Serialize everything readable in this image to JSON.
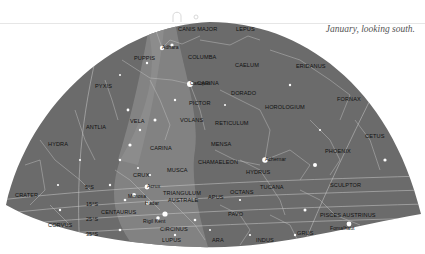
{
  "caption": "January, looking south.",
  "colors": {
    "sky": "#6b6b6b",
    "milky_way": "#8a8a8a",
    "lines": "#c8c8c8",
    "stars": "#ffffff",
    "labels": "#111111",
    "background": "#ffffff"
  },
  "constellations": [
    {
      "name": "CANIS MAJOR",
      "x": 178,
      "y": 30
    },
    {
      "name": "LEPUS",
      "x": 236,
      "y": 30
    },
    {
      "name": "PUPPIS",
      "x": 134,
      "y": 59
    },
    {
      "name": "COLUMBA",
      "x": 188,
      "y": 58
    },
    {
      "name": "CAELUM",
      "x": 235,
      "y": 66
    },
    {
      "name": "ERIDANUS",
      "x": 296,
      "y": 67
    },
    {
      "name": "PYXIS",
      "x": 95,
      "y": 87
    },
    {
      "name": "CARINA",
      "x": 197,
      "y": 84
    },
    {
      "name": "DORADO",
      "x": 231,
      "y": 94
    },
    {
      "name": "PICTOR",
      "x": 189,
      "y": 104
    },
    {
      "name": "HOROLOGIUM",
      "x": 265,
      "y": 108
    },
    {
      "name": "FORNAX",
      "x": 337,
      "y": 100
    },
    {
      "name": "VELA",
      "x": 130,
      "y": 122
    },
    {
      "name": "VOLANS",
      "x": 180,
      "y": 121
    },
    {
      "name": "RETICULUM",
      "x": 215,
      "y": 124
    },
    {
      "name": "ANTLIA",
      "x": 86,
      "y": 128
    },
    {
      "name": "CETUS",
      "x": 365,
      "y": 137
    },
    {
      "name": "MENSA",
      "x": 211,
      "y": 145
    },
    {
      "name": "HYDRA",
      "x": 48,
      "y": 145
    },
    {
      "name": "CARINA",
      "x": 150,
      "y": 149
    },
    {
      "name": "PHOENIX",
      "x": 325,
      "y": 152
    },
    {
      "name": "CHAMAELEON",
      "x": 198,
      "y": 163
    },
    {
      "name": "HYDRUS",
      "x": 246,
      "y": 173
    },
    {
      "name": "MUSCA",
      "x": 167,
      "y": 171
    },
    {
      "name": "CRUX",
      "x": 133,
      "y": 176
    },
    {
      "name": "SCULPTOR",
      "x": 330,
      "y": 186
    },
    {
      "name": "TUCANA",
      "x": 260,
      "y": 188
    },
    {
      "name": "OCTANS",
      "x": 230,
      "y": 193
    },
    {
      "name": "TRIANGULUM",
      "x": 163,
      "y": 194
    },
    {
      "name": "AUSTRALE",
      "x": 168,
      "y": 201
    },
    {
      "name": "APUS",
      "x": 208,
      "y": 198
    },
    {
      "name": "CRATER",
      "x": 15,
      "y": 196
    },
    {
      "name": "CENTAURUS",
      "x": 101,
      "y": 213
    },
    {
      "name": "PAVO",
      "x": 228,
      "y": 215
    },
    {
      "name": "PISCES AUSTRINUS",
      "x": 320,
      "y": 216
    },
    {
      "name": "CORVUS",
      "x": 48,
      "y": 226
    },
    {
      "name": "CIRCINUS",
      "x": 160,
      "y": 230
    },
    {
      "name": "GRUS",
      "x": 297,
      "y": 234
    },
    {
      "name": "LUPUS",
      "x": 162,
      "y": 241
    },
    {
      "name": "ARA",
      "x": 212,
      "y": 241
    },
    {
      "name": "INDUS",
      "x": 256,
      "y": 241
    }
  ],
  "stars": [
    {
      "name": "Adhara",
      "x": 162,
      "y": 48
    },
    {
      "name": "Canopus",
      "x": 190,
      "y": 84
    },
    {
      "name": "Achernar",
      "x": 265,
      "y": 160
    },
    {
      "name": "Acrux",
      "x": 147,
      "y": 187
    },
    {
      "name": "Mimosa",
      "x": 128,
      "y": 197
    },
    {
      "name": "Hadar",
      "x": 145,
      "y": 204
    },
    {
      "name": "Rigil Kent",
      "x": 143,
      "y": 222
    },
    {
      "name": "Fomalhaut",
      "x": 330,
      "y": 229
    }
  ],
  "declinations": [
    {
      "label": "5°S",
      "x": 85,
      "y": 188
    },
    {
      "label": "15°S",
      "x": 86,
      "y": 205
    },
    {
      "label": "25°S",
      "x": 86,
      "y": 220
    },
    {
      "label": "35°S",
      "x": 86,
      "y": 235
    }
  ]
}
